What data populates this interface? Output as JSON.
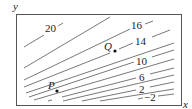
{
  "figure": {
    "type": "contour-map",
    "axes": {
      "x_label": "x",
      "y_label": "y"
    },
    "contour_labels": [
      "20",
      "16",
      "14",
      "10",
      "6",
      "2",
      "-2"
    ],
    "points": [
      {
        "name": "P"
      },
      {
        "name": "Q"
      }
    ],
    "colors": {
      "frame": "#555555",
      "contour": "#555555",
      "text": "#222222"
    }
  },
  "labels": {
    "y_axis": "y",
    "x_axis": "x",
    "c20": "20",
    "c16": "16",
    "c14": "14",
    "c10": "10",
    "c6": "6",
    "c2": "2",
    "cm2": "−2",
    "P": "P",
    "Q": "Q"
  }
}
